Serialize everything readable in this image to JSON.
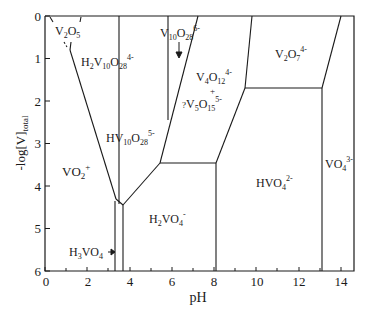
{
  "diagram": {
    "type": "speciation-diagram",
    "xlabel": "pH",
    "ylabel": "-log[V]",
    "ylabel_sub": "total",
    "x_ticks": [
      "0",
      "2",
      "4",
      "6",
      "8",
      "10",
      "12",
      "14"
    ],
    "y_ticks": [
      "0",
      "1",
      "2",
      "3",
      "4",
      "5",
      "6"
    ],
    "species": {
      "v2o5": {
        "base": "V",
        "s1": "2",
        "mid": "O",
        "s2": "5"
      },
      "h2v10o28": {
        "p1": "H",
        "s1": "2",
        "p2": "V",
        "s2": "10",
        "p3": "O",
        "s3": "28",
        "charge": "4-"
      },
      "v10o28": {
        "p1": "V",
        "s1": "10",
        "p2": "O",
        "s2": "28",
        "charge": "6-"
      },
      "v4o12": {
        "p1": "V",
        "s1": "4",
        "p2": "O",
        "s2": "12",
        "charge": "4-"
      },
      "plus": "+",
      "v5o15": {
        "prefix": "?",
        "p1": "V",
        "s1": "5",
        "p2": "O",
        "s2": "15",
        "charge": "5-"
      },
      "v2o7": {
        "p1": "V",
        "s1": "2",
        "p2": "O",
        "s2": "7",
        "charge": "4-"
      },
      "hv10o28": {
        "p1": "HV",
        "s1": "10",
        "p2": "O",
        "s2": "28",
        "charge": "5-"
      },
      "vo2": {
        "p1": "VO",
        "s1": "2",
        "charge": "+"
      },
      "h2vo4": {
        "p1": "H",
        "s1": "2",
        "p2": "VO",
        "s2": "4",
        "charge": "-"
      },
      "hvo4": {
        "p1": "HVO",
        "s1": "4",
        "charge": "2-"
      },
      "vo4": {
        "p1": "VO",
        "s1": "4",
        "charge": "3-"
      },
      "h3vo4": {
        "p1": "H",
        "s1": "3",
        "p2": "VO",
        "s2": "4"
      }
    }
  }
}
